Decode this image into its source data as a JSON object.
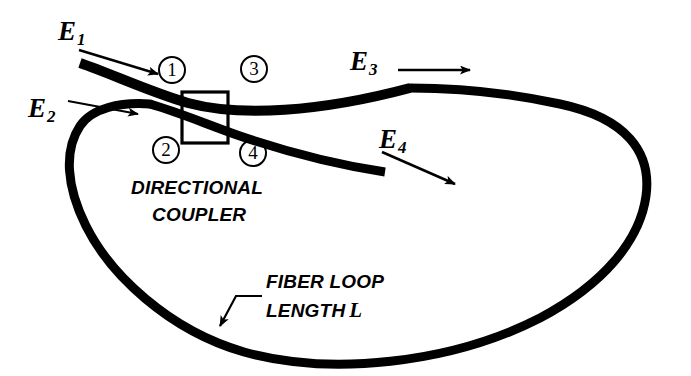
{
  "figure": {
    "background_color": "#ffffff",
    "stroke_color": "#000000",
    "width": 691,
    "height": 376
  },
  "field_labels": [
    {
      "id": "E1",
      "base": "E",
      "subscript": "1",
      "x": 58,
      "y": 18,
      "arrow": "thin-arrow-down-right"
    },
    {
      "id": "E2",
      "base": "E",
      "subscript": "2",
      "x": 28,
      "y": 95,
      "arrow": "thin-arrow-right"
    },
    {
      "id": "E3",
      "base": "E",
      "subscript": "3",
      "x": 350,
      "y": 48,
      "arrow": "thin-arrow-right"
    },
    {
      "id": "E4",
      "base": "E",
      "subscript": "4",
      "x": 379,
      "y": 126,
      "arrow": "thin-arrow-down-right"
    }
  ],
  "ports": [
    {
      "number": "1",
      "x": 158,
      "y": 56
    },
    {
      "number": "3",
      "x": 240,
      "y": 55
    },
    {
      "number": "2",
      "x": 152,
      "y": 136
    },
    {
      "number": "4",
      "x": 239,
      "y": 139
    }
  ],
  "coupler": {
    "label_line_1": "DIRECTIONAL",
    "label_line_2": "COUPLER",
    "label_1_x": 131,
    "label_1_y": 178,
    "label_2_x": 152,
    "label_2_y": 205,
    "box": {
      "x": 182,
      "y": 92,
      "width": 46,
      "height": 51
    }
  },
  "loop": {
    "label_line_1": "FIBER LOOP",
    "label_line_2": "LENGTH",
    "length_variable": "L",
    "label_1_x": 266,
    "label_1_y": 272,
    "label_2_x": 266,
    "label_2_y": 300,
    "leader": "bent-leader-arrow-down-left"
  }
}
